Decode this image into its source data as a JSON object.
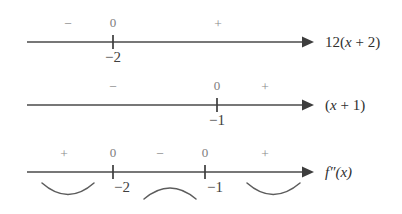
{
  "figure": {
    "background_color": "#ffffff",
    "line_color": "#4a4a4a",
    "sign_color": "#8a8a8a",
    "text_color": "#3f3f3f"
  },
  "lines": [
    {
      "id": "line-1",
      "expression_prefix": "12(",
      "expression_var": "x",
      "expression_suffix": " + 2)",
      "expression_full": "12(x + 2)",
      "signs": [
        {
          "symbol": "−",
          "x": 68
        },
        {
          "symbol": "+",
          "x": 218
        }
      ],
      "zeros": [
        {
          "zero_label": "0",
          "root_label": "−2",
          "x": 113
        }
      ]
    },
    {
      "id": "line-2",
      "expression_prefix": "(",
      "expression_var": "x",
      "expression_suffix": " + 1)",
      "expression_full": "(x + 1)",
      "signs": [
        {
          "symbol": "−",
          "x": 113
        },
        {
          "symbol": "+",
          "x": 265
        }
      ],
      "zeros": [
        {
          "zero_label": "0",
          "root_label": "−1",
          "x": 217
        }
      ]
    },
    {
      "id": "line-3",
      "expression_prefix": "f",
      "expression_var": "″",
      "expression_suffix": "(x)",
      "expression_full": "f″(x)",
      "signs": [
        {
          "symbol": "+",
          "x": 64
        },
        {
          "symbol": "−",
          "x": 160
        },
        {
          "symbol": "+",
          "x": 265
        }
      ],
      "zeros": [
        {
          "zero_label": "0",
          "root_label": "−2",
          "x": 113
        },
        {
          "zero_label": "0",
          "root_label": "−1",
          "x": 205
        }
      ],
      "concavity_arcs": [
        {
          "shape": "concave-up",
          "x_start": 42,
          "x_end": 94
        },
        {
          "shape": "concave-down",
          "x_start": 144,
          "x_end": 196
        },
        {
          "shape": "concave-up",
          "x_start": 247,
          "x_end": 300
        }
      ]
    }
  ],
  "labels": {
    "line1_expression": "12(x + 2)",
    "line2_expression": "(x + 1)",
    "line3_expression": "f″(x)"
  }
}
